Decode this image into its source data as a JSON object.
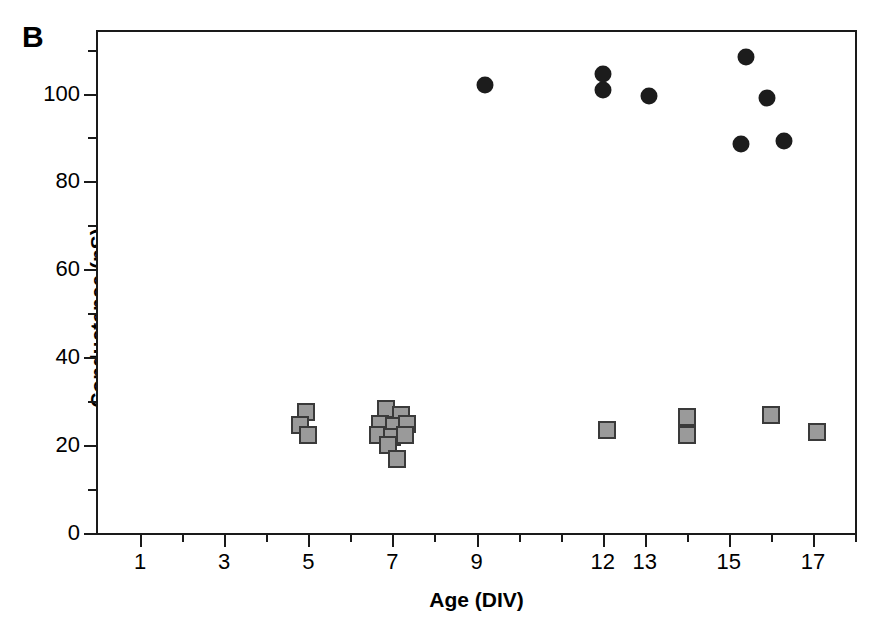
{
  "figure": {
    "panel_label": "B",
    "background_color": "#ffffff"
  },
  "chart_data": {
    "type": "scatter",
    "title": "",
    "panel": "B",
    "xlabel": "Age (DIV)",
    "ylabel": "Conductance (pS)",
    "xlim": [
      0,
      18
    ],
    "ylim": [
      0,
      114
    ],
    "grid": false,
    "legend": "none",
    "x_ticks_major": [
      1,
      3,
      5,
      7,
      9,
      12,
      13,
      15,
      17
    ],
    "x_tick_labels": [
      "1",
      "3",
      "5",
      "7",
      "9",
      "12",
      "13",
      "15",
      "17"
    ],
    "x_ticks_minor": [
      2,
      4,
      6,
      8,
      10,
      11,
      14,
      16,
      18
    ],
    "y_ticks_major": [
      0,
      20,
      40,
      60,
      80,
      100
    ],
    "y_tick_labels": [
      "0",
      "20",
      "40",
      "60",
      "80",
      "100"
    ],
    "y_ticks_minor": [
      10,
      30,
      50,
      70,
      90,
      110
    ],
    "series": [
      {
        "name": "large-conductance",
        "marker": "circle",
        "marker_color": "#1c1c1c",
        "marker_edge_color": "#1c1c1c",
        "points": [
          {
            "x": 9.2,
            "y": 102.0
          },
          {
            "x": 12.0,
            "y": 104.5
          },
          {
            "x": 12.0,
            "y": 100.8
          },
          {
            "x": 13.1,
            "y": 99.4
          },
          {
            "x": 15.4,
            "y": 108.3
          },
          {
            "x": 15.9,
            "y": 98.9
          },
          {
            "x": 15.3,
            "y": 88.5
          },
          {
            "x": 16.3,
            "y": 89.2
          }
        ]
      },
      {
        "name": "small-conductance",
        "marker": "square",
        "marker_color": "#9a9a9a",
        "marker_edge_color": "#3a3a3a",
        "points": [
          {
            "x": 4.95,
            "y": 27.5
          },
          {
            "x": 4.8,
            "y": 24.6
          },
          {
            "x": 5.0,
            "y": 22.4
          },
          {
            "x": 6.85,
            "y": 28.3
          },
          {
            "x": 7.2,
            "y": 26.8
          },
          {
            "x": 6.7,
            "y": 24.9
          },
          {
            "x": 7.05,
            "y": 24.3
          },
          {
            "x": 7.35,
            "y": 24.7
          },
          {
            "x": 6.65,
            "y": 22.3
          },
          {
            "x": 7.0,
            "y": 21.8
          },
          {
            "x": 7.3,
            "y": 22.2
          },
          {
            "x": 6.9,
            "y": 20.0
          },
          {
            "x": 7.1,
            "y": 16.8
          },
          {
            "x": 12.1,
            "y": 23.4
          },
          {
            "x": 14.0,
            "y": 26.4
          },
          {
            "x": 14.0,
            "y": 22.2
          },
          {
            "x": 16.0,
            "y": 26.9
          },
          {
            "x": 17.1,
            "y": 23.0
          }
        ]
      }
    ]
  }
}
